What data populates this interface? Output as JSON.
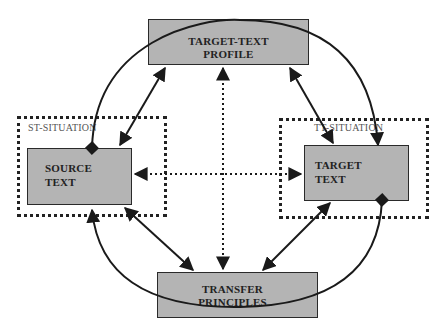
{
  "diagram": {
    "nodes": {
      "target_text_profile": {
        "line1": "TARGET-TEXT",
        "line2": "PROFILE"
      },
      "source_text": {
        "line1": "SOURCE",
        "line2": "TEXT"
      },
      "target_text": {
        "line1": "TARGET",
        "line2": "TEXT"
      },
      "transfer_principles": {
        "line1": "TRANSFER",
        "line2": "PRINCIPLES"
      }
    },
    "groups": {
      "st_situation": {
        "label": "ST-SITUATION"
      },
      "tt_situation": {
        "label": "TT-SITUATION"
      }
    },
    "edges": [
      {
        "from": "source_text",
        "to": "target_text_profile",
        "style": "solid",
        "arrows": "both"
      },
      {
        "from": "target_text",
        "to": "target_text_profile",
        "style": "solid",
        "arrows": "both"
      },
      {
        "from": "source_text",
        "to": "transfer_principles",
        "style": "solid",
        "arrows": "both"
      },
      {
        "from": "target_text",
        "to": "transfer_principles",
        "style": "solid",
        "arrows": "both"
      },
      {
        "from": "source_text",
        "to": "target_text",
        "style": "dotted",
        "arrows": "both"
      },
      {
        "from": "target_text_profile",
        "to": "transfer_principles",
        "style": "dotted",
        "arrows": "both"
      },
      {
        "from": "source_text",
        "to": "target_text",
        "style": "solid-arc-top",
        "arrows": "diamond-start, arrow-end"
      },
      {
        "from": "target_text",
        "to": "source_text",
        "style": "solid-arc-bottom",
        "arrows": "diamond-start, arrow-end"
      }
    ],
    "colors": {
      "box_fill": "#b4b4b4",
      "stroke": "#1a1a1a"
    }
  }
}
